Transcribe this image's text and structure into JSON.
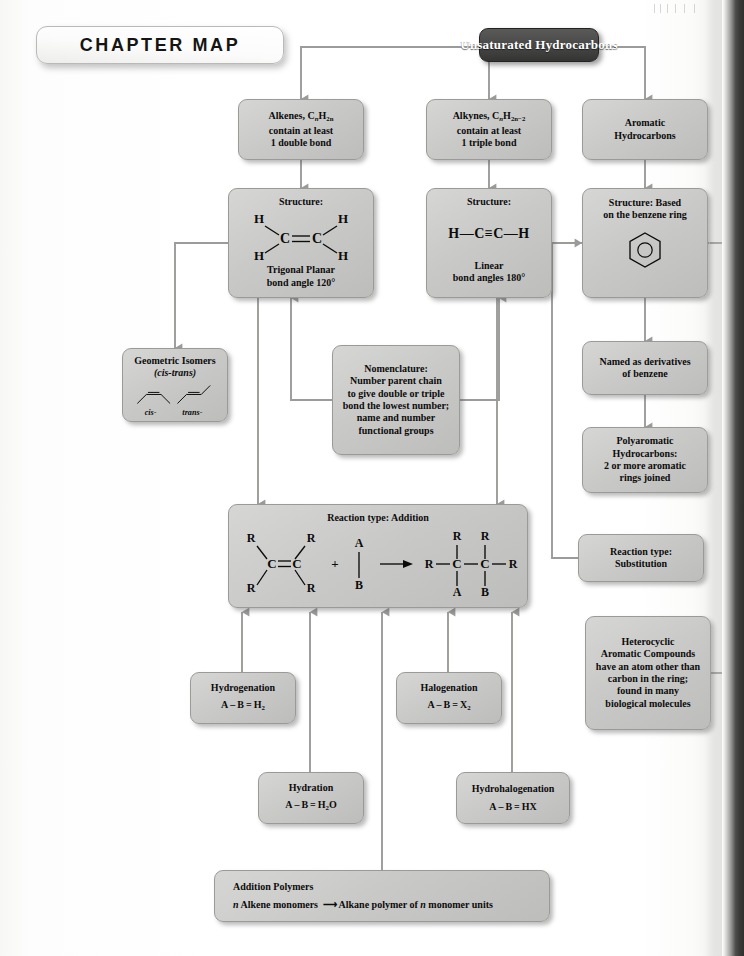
{
  "page": {
    "banner_title": "CHAPTER MAP",
    "accent_box_color": "#3f3f3e",
    "node_fill_color": "#c9c9c7",
    "connector_color": "#9b9b99"
  },
  "nodes": {
    "root": {
      "label": "Unsaturated Hydrocarbons"
    },
    "alkenes": {
      "line1_a": "Alkenes, C",
      "line1_sub1": "n",
      "line1_b": "H",
      "line1_sub2": "2n",
      "line2": "contain at least",
      "line3": "1 double bond"
    },
    "alkynes": {
      "line1_a": "Alkynes, C",
      "line1_sub1": "n",
      "line1_b": "H",
      "line1_sub2": "2n−2",
      "line2": "contain at least",
      "line3": "1 triple bond"
    },
    "aromatic": {
      "line1": "Aromatic",
      "line2": "Hydrocarbons"
    },
    "alkene_structure": {
      "title": "Structure:",
      "caption1": "Trigonal Planar",
      "caption2": "bond angle 120°",
      "atoms": [
        "H",
        "H",
        "C",
        "C",
        "H",
        "H"
      ]
    },
    "alkyne_structure": {
      "title": "Structure:",
      "formula": "H—C≡C—H",
      "caption1": "Linear",
      "caption2": "bond angles 180°"
    },
    "benzene_structure": {
      "line1": "Structure: Based",
      "line2": "on the benzene ring",
      "icon": "benzene-ring"
    },
    "geometric_isomers": {
      "line1": "Geometric Isomers",
      "line2": "(cis-trans)",
      "label_cis": "cis-",
      "label_trans": "trans-"
    },
    "nomenclature": {
      "line1": "Nomenclature:",
      "line2": "Number parent chain",
      "line3": "to give double or triple",
      "line4": "bond the lowest number;",
      "line5": "name and number",
      "line6": "functional groups"
    },
    "named_derivatives": {
      "line1": "Named as derivatives",
      "line2": "of benzene"
    },
    "polyaromatic": {
      "line1": "Polyaromatic",
      "line2": "Hydrocarbons:",
      "line3": "2 or more aromatic",
      "line4": "rings joined"
    },
    "reaction_addition": {
      "title": "Reaction type: Addition",
      "reagent_plus": "+",
      "arrow": "→",
      "labels": [
        "R",
        "R",
        "C",
        "C",
        "R",
        "R",
        "A",
        "B",
        "R",
        "R",
        "C",
        "C",
        "R",
        "A",
        "B"
      ]
    },
    "reaction_substitution": {
      "line1": "Reaction type:",
      "line2": "Substitution"
    },
    "heterocyclic": {
      "line1": "Heterocyclic",
      "line2": "Aromatic Compounds",
      "line3": "have an atom other than",
      "line4": "carbon in the ring;",
      "line5": "found in many",
      "line6": "biological molecules"
    },
    "hydrogenation": {
      "line1": "Hydrogenation",
      "formula_pre": "A – B = H",
      "formula_sub": "2"
    },
    "halogenation": {
      "line1": "Halogenation",
      "formula_pre": "A – B = X",
      "formula_sub": "2"
    },
    "hydration": {
      "line1": "Hydration",
      "formula_pre": "A – B = H",
      "formula_sub": "2",
      "formula_post": "O"
    },
    "hydrohalogenation": {
      "line1": "Hydrohalogenation",
      "formula": "A – B = HX"
    },
    "addition_polymers": {
      "title": "Addition Polymers",
      "left_n": "n",
      "left_text": " Alkene monomers",
      "arrow": "⟶",
      "right_a": "Alkane polymer of ",
      "right_n": "n",
      "right_b": " monomer units"
    }
  }
}
